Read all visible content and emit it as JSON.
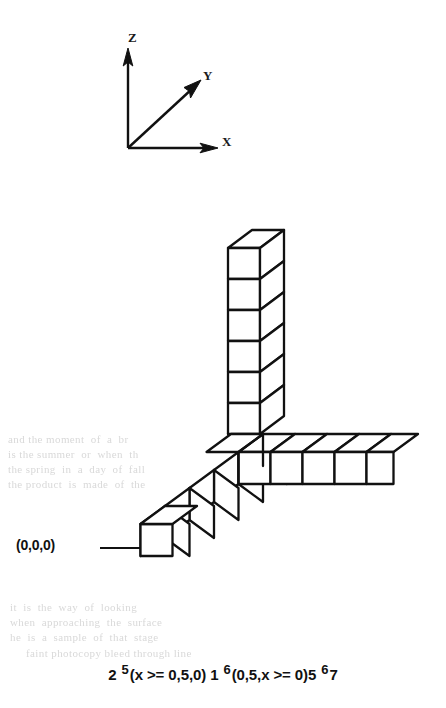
{
  "figure": {
    "type": "isometric-cube-diagram",
    "background_color": "#ffffff",
    "line_color": "#111111"
  },
  "axes": {
    "z_label": "Z",
    "y_label": "Y",
    "x_label": "X",
    "origin_px": [
      128,
      148
    ]
  },
  "origin_annotation": {
    "label": "(0,0,0)",
    "arrow": "arrow-right"
  },
  "caption": {
    "num1": "2",
    "sup1": "5",
    "expr1": "(x >= 0,5,0)",
    "num2": "1",
    "sup2": "6",
    "expr2": "(0,5,x >= 0)",
    "num3": "5",
    "sup3": "6",
    "num4": "7",
    "full_text": "2 5(x >= 0,5,0) 1 6(0,5,x >= 0)5 67"
  },
  "bleed_text": {
    "block_left": "and the moment  of  a  br\nis the summer  or  when  th\nthe spring  in  a  day  of  fall\nthe product  is  made  of  the",
    "block_left2": "it  is  the  way  of  looking\nwhen  approaching  the  surface\nhe  is  a  sample  of  that  stage",
    "block_top": "faint photocopy bleed through line"
  },
  "structure": {
    "arm_z_cubes": 6,
    "arm_x_cubes": 5,
    "arm_y_cubes": 5,
    "note": "three orthogonal chains of unit cubes meeting at a corner"
  }
}
